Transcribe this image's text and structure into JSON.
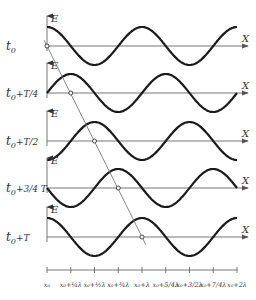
{
  "layout": {
    "x0_px": 47,
    "lambda_px": 95,
    "amplitude_px": 19,
    "axis_end_px": 248,
    "wave_extent_lambdas": 2
  },
  "rows": [
    {
      "time_label_main": "t",
      "time_label_sub": "0",
      "time_label_extra": "",
      "axis_y": 46,
      "phase_quarter_periods": 0,
      "e_label": "E",
      "x_label": "X"
    },
    {
      "time_label_main": "t",
      "time_label_sub": "0",
      "time_label_extra": "+T/4",
      "axis_y": 93,
      "phase_quarter_periods": 1,
      "e_label": "E",
      "x_label": "X"
    },
    {
      "time_label_main": "t",
      "time_label_sub": "0",
      "time_label_extra": "+T/2",
      "axis_y": 141,
      "phase_quarter_periods": 2,
      "e_label": "E",
      "x_label": "X"
    },
    {
      "time_label_main": "t",
      "time_label_sub": "0",
      "time_label_extra": "+3/4 T",
      "axis_y": 188,
      "phase_quarter_periods": 3,
      "e_label": "E",
      "x_label": "X"
    },
    {
      "time_label_main": "t",
      "time_label_sub": "0",
      "time_label_extra": "+T",
      "axis_y": 237,
      "phase_quarter_periods": 4,
      "e_label": "E",
      "x_label": "X"
    }
  ],
  "x_axis": {
    "y": 270,
    "ticks": [
      {
        "label": "x₀"
      },
      {
        "label": "x₀+¼λ"
      },
      {
        "label": "x₀+½λ"
      },
      {
        "label": "x₀+¾λ"
      },
      {
        "label": "x₀+λ"
      },
      {
        "label": "x₀+5/4λ"
      },
      {
        "label": "x₀+3/2λ"
      },
      {
        "label": "x₀+7/4λ"
      },
      {
        "label": "x₀+2λ"
      }
    ]
  },
  "phase_marker_line": {
    "description": "Line through constant-phase points showing wave propagation by lambda/4 per T/4",
    "points_x_quarter_lambdas": [
      0,
      1,
      2,
      3,
      4
    ]
  }
}
